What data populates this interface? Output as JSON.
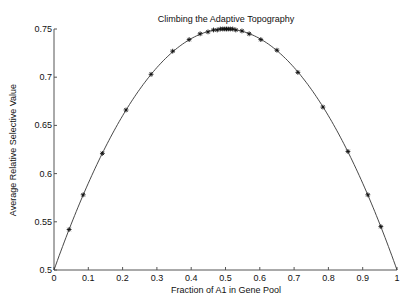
{
  "chart_data": {
    "type": "line",
    "title": "Climbing the Adaptive Topography",
    "xlabel": "Fraction of A1 in Gene Pool",
    "ylabel": "Average Relative Selective Value",
    "xlim": [
      0,
      1
    ],
    "ylim": [
      0.5,
      0.75
    ],
    "xticks": [
      0,
      0.1,
      0.2,
      0.3,
      0.4,
      0.5,
      0.6,
      0.7,
      0.8,
      0.9,
      1
    ],
    "xtick_labels": [
      "0",
      "0.1",
      "0.2",
      "0.3",
      "0.4",
      "0.5",
      "0.6",
      "0.7",
      "0.8",
      "0.9",
      "1"
    ],
    "yticks": [
      0.5,
      0.55,
      0.6,
      0.65,
      0.7,
      0.75
    ],
    "ytick_labels": [
      "0.5",
      "0.55",
      "0.6",
      "0.65",
      "0.7",
      "0.75"
    ],
    "grid": false,
    "legend": "none",
    "series": [
      {
        "name": "mean fitness curve",
        "style": "line",
        "color": "#333333",
        "formula": "0.5 + p*(1-p)",
        "x": [
          0,
          0.05,
          0.1,
          0.15,
          0.2,
          0.25,
          0.3,
          0.35,
          0.4,
          0.45,
          0.5,
          0.55,
          0.6,
          0.65,
          0.7,
          0.75,
          0.8,
          0.85,
          0.9,
          0.95,
          1
        ],
        "y": [
          0.5,
          0.5475,
          0.59,
          0.6275,
          0.66,
          0.6875,
          0.71,
          0.7275,
          0.74,
          0.7475,
          0.75,
          0.7475,
          0.74,
          0.7275,
          0.71,
          0.6875,
          0.66,
          0.6275,
          0.59,
          0.5475,
          0.5
        ]
      },
      {
        "name": "generations",
        "style": "markers",
        "marker": "asterisk",
        "color": "#111111",
        "x": [
          0.044,
          0.085,
          0.141,
          0.21,
          0.283,
          0.346,
          0.394,
          0.426,
          0.449,
          0.465,
          0.476,
          0.485,
          0.492,
          0.498,
          0.503,
          0.508,
          0.514,
          0.521,
          0.53,
          0.548,
          0.569,
          0.603,
          0.65,
          0.711,
          0.784,
          0.857,
          0.915,
          0.953
        ],
        "y": [
          0.542,
          0.578,
          0.621,
          0.666,
          0.703,
          0.727,
          0.739,
          0.745,
          0.747,
          0.749,
          0.749,
          0.75,
          0.75,
          0.75,
          0.75,
          0.75,
          0.75,
          0.75,
          0.749,
          0.748,
          0.745,
          0.739,
          0.728,
          0.705,
          0.669,
          0.623,
          0.578,
          0.545
        ]
      }
    ]
  }
}
